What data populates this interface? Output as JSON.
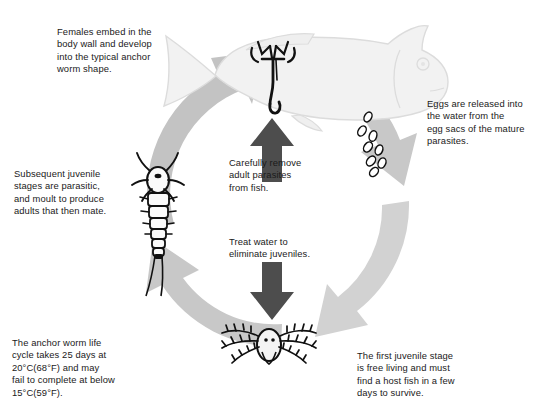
{
  "diagram": {
    "colors": {
      "ring_arrow": "#c8c8c8",
      "ring_arrow_light": "#d8d8d8",
      "dark_arrow": "#4d4d4d",
      "fish_fill": "#f2f2f2",
      "fish_stroke": "#d9d9d9",
      "organism_stroke": "#111111",
      "text": "#1a1a1a",
      "background": "#ffffff"
    },
    "captions": {
      "females": "Females embed in the\nbody wall and develop\ninto the typical anchor\nworm shape.",
      "eggs": "Eggs are released into\nthe water from the\negg sacs of the mature\nparasites.",
      "subsequent_juvenile": "Subsequent juvenile\nstages are parasitic,\nand moult to produce\nadults that then mate.",
      "remove_adults": "Carefully remove\nadult parasites\nfrom fish.",
      "treat_water": "Treat water to\neliminate juveniles.",
      "life_cycle_duration": "The anchor worm life\ncycle takes 25 days at\n20°C(68°F) and may\nfail to complete at below\n15°C(59°F).",
      "first_juvenile": "The first juvenile stage\nis free living and must\nfind a host fish in a few\ndays to survive."
    },
    "stages": [
      {
        "name": "adult-female-on-fish",
        "position": "top",
        "label": "Adult anchor worm embedded in fish"
      },
      {
        "name": "eggs",
        "position": "right",
        "label": "Eggs released from egg sacs"
      },
      {
        "name": "nauplius-larva",
        "position": "bottom",
        "label": "First free-living juvenile stage"
      },
      {
        "name": "copepodid-juvenile",
        "position": "left",
        "label": "Parasitic juvenile stage"
      }
    ],
    "ring_arrows": [
      {
        "name": "arrow-fish-to-eggs",
        "direction": "clockwise",
        "from": "adult-female-on-fish",
        "to": "eggs"
      },
      {
        "name": "arrow-eggs-to-nauplius",
        "direction": "clockwise",
        "from": "eggs",
        "to": "nauplius-larva"
      },
      {
        "name": "arrow-nauplius-to-juvenile",
        "direction": "clockwise",
        "from": "nauplius-larva",
        "to": "copepodid-juvenile"
      },
      {
        "name": "arrow-juvenile-to-fish",
        "direction": "clockwise",
        "from": "copepodid-juvenile",
        "to": "adult-female-on-fish"
      }
    ],
    "treatment_arrows": [
      {
        "name": "treatment-arrow-up",
        "direction": "up",
        "caption_key": "remove_adults"
      },
      {
        "name": "treatment-arrow-down",
        "direction": "down",
        "caption_key": "treat_water"
      }
    ],
    "egg_count": 8
  }
}
